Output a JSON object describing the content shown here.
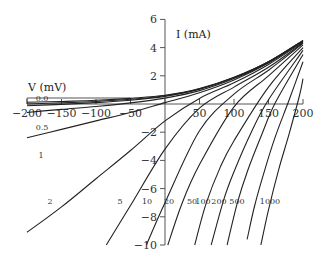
{
  "chart_data": {
    "type": "line",
    "title": "",
    "xlabel": "V (mV)",
    "ylabel": "I (mA)",
    "xlim": [
      -200,
      200
    ],
    "ylim": [
      -10,
      6
    ],
    "grid": false,
    "x_ticks": [
      -200,
      -150,
      -100,
      -50,
      0,
      50,
      100,
      150,
      200
    ],
    "x_tick_labels": [
      "−200",
      "−150",
      "−100",
      "−50",
      "",
      "50",
      "100",
      "150",
      "200"
    ],
    "y_ticks": [
      6,
      4,
      2,
      -2,
      -4,
      -6,
      -8,
      -10
    ],
    "y_tick_labels": [
      "6",
      "4",
      "2",
      "−2",
      "−4",
      "−6",
      "−8",
      "−10"
    ],
    "series": [
      {
        "name": "0.0",
        "label_pos": [
          42,
          101
        ],
        "points": [
          [
            -200,
            0.12
          ],
          [
            -150,
            0.18
          ],
          [
            -100,
            0.26
          ],
          [
            -50,
            0.4
          ],
          [
            0,
            0.62
          ],
          [
            50,
            1.1
          ],
          [
            100,
            1.9
          ],
          [
            150,
            3.0
          ],
          [
            200,
            4.5
          ]
        ]
      },
      {
        "name": "0.1",
        "label_pos": [
          0,
          0
        ],
        "points": [
          [
            -200,
            0.0
          ],
          [
            -150,
            0.08
          ],
          [
            -100,
            0.18
          ],
          [
            -50,
            0.33
          ],
          [
            0,
            0.58
          ],
          [
            50,
            1.07
          ],
          [
            100,
            1.88
          ],
          [
            150,
            3.0
          ],
          [
            200,
            4.5
          ]
        ]
      },
      {
        "name": "0.2",
        "label_pos": [
          0,
          0
        ],
        "points": [
          [
            -200,
            -0.12
          ],
          [
            -150,
            -0.03
          ],
          [
            -100,
            0.1
          ],
          [
            -50,
            0.27
          ],
          [
            0,
            0.54
          ],
          [
            50,
            1.04
          ],
          [
            100,
            1.86
          ],
          [
            150,
            2.98
          ],
          [
            200,
            4.5
          ]
        ]
      },
      {
        "name": "0.5",
        "label_pos": [
          42,
          130
        ],
        "points": [
          [
            -200,
            -0.6
          ],
          [
            -150,
            -0.38
          ],
          [
            -100,
            -0.18
          ],
          [
            -50,
            0.08
          ],
          [
            0,
            0.42
          ],
          [
            50,
            0.95
          ],
          [
            100,
            1.8
          ],
          [
            150,
            2.95
          ],
          [
            200,
            4.48
          ]
        ]
      },
      {
        "name": "1",
        "label_pos": [
          41,
          158
        ],
        "points": [
          [
            -200,
            -2.4
          ],
          [
            -150,
            -1.8
          ],
          [
            -100,
            -1.2
          ],
          [
            -50,
            -0.6
          ],
          [
            0,
            0.1
          ],
          [
            50,
            0.8
          ],
          [
            100,
            1.7
          ],
          [
            150,
            2.9
          ],
          [
            200,
            4.45
          ]
        ]
      },
      {
        "name": "2",
        "label_pos": [
          50,
          204
        ],
        "points": [
          [
            -200,
            -9.1
          ],
          [
            -150,
            -7.3
          ],
          [
            -100,
            -5.3
          ],
          [
            -50,
            -3.3
          ],
          [
            0,
            -1.2
          ],
          [
            50,
            0.4
          ],
          [
            100,
            1.5
          ],
          [
            150,
            2.8
          ],
          [
            200,
            4.4
          ]
        ]
      },
      {
        "name": "5",
        "label_pos": [
          120,
          204
        ],
        "points": [
          [
            -85,
            -10
          ],
          [
            -50,
            -7.2
          ],
          [
            0,
            -3.2
          ],
          [
            50,
            -0.3
          ],
          [
            100,
            1.2
          ],
          [
            150,
            2.6
          ],
          [
            200,
            4.35
          ]
        ]
      },
      {
        "name": "10",
        "label_pos": [
          147,
          204
        ],
        "points": [
          [
            -27,
            -10
          ],
          [
            0,
            -7.0
          ],
          [
            50,
            -1.9
          ],
          [
            100,
            0.7
          ],
          [
            150,
            2.4
          ],
          [
            200,
            4.3
          ]
        ]
      },
      {
        "name": "20",
        "label_pos": [
          169,
          204
        ],
        "points": [
          [
            4,
            -10
          ],
          [
            25,
            -7.0
          ],
          [
            50,
            -4.3
          ],
          [
            100,
            -0.2
          ],
          [
            150,
            2.0
          ],
          [
            200,
            4.2
          ]
        ]
      },
      {
        "name": "50",
        "label_pos": [
          192,
          204
        ],
        "points": [
          [
            43,
            -10
          ],
          [
            60,
            -7.0
          ],
          [
            80,
            -4.5
          ],
          [
            100,
            -2.6
          ],
          [
            150,
            1.2
          ],
          [
            200,
            4.0
          ]
        ]
      },
      {
        "name": "100",
        "label_pos": [
          203,
          204
        ],
        "points": [
          [
            67,
            -10
          ],
          [
            85,
            -6.8
          ],
          [
            100,
            -4.8
          ],
          [
            125,
            -2.0
          ],
          [
            150,
            0.3
          ],
          [
            200,
            3.8
          ]
        ]
      },
      {
        "name": "200",
        "label_pos": [
          219,
          204
        ],
        "points": [
          [
            90,
            -10
          ],
          [
            105,
            -7.0
          ],
          [
            120,
            -4.7
          ],
          [
            140,
            -2.2
          ],
          [
            160,
            0.1
          ],
          [
            200,
            3.5
          ]
        ]
      },
      {
        "name": "500",
        "label_pos": [
          237,
          204
        ],
        "points": [
          [
            119,
            -9.6
          ],
          [
            130,
            -7.2
          ],
          [
            145,
            -4.6
          ],
          [
            160,
            -2.3
          ],
          [
            180,
            0.3
          ],
          [
            200,
            3.0
          ]
        ]
      },
      {
        "name": "1000",
        "label_pos": [
          270,
          204
        ],
        "points": [
          [
            139,
            -10
          ],
          [
            150,
            -7.5
          ],
          [
            165,
            -4.6
          ],
          [
            180,
            -2.1
          ],
          [
            195,
            0.6
          ],
          [
            200,
            1.8
          ]
        ]
      }
    ]
  },
  "axes": {
    "x_title": "V (mV)",
    "y_title": "I (mA)",
    "bundle_labels": [
      "0.0",
      "0.1",
      "0.2"
    ]
  }
}
